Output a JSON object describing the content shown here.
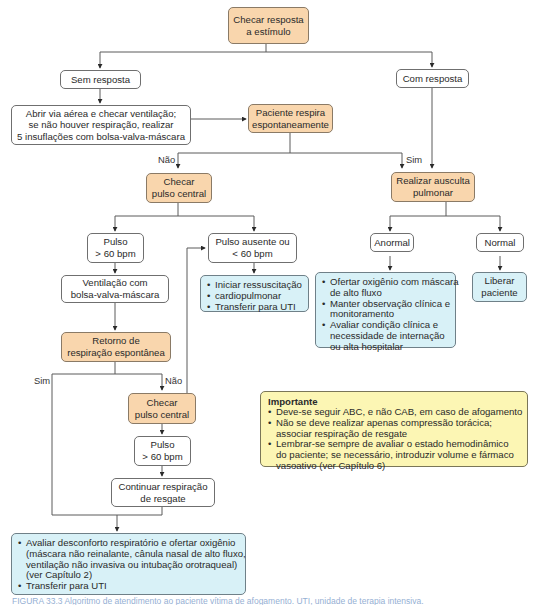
{
  "diagram": {
    "colors": {
      "decision_fill": "#f9d6ad",
      "action_fill": "#d8f1f7",
      "note_fill": "#fcf6b4",
      "plain_fill": "#ffffff",
      "line": "#555555"
    },
    "nodes": {
      "checar_resposta": {
        "lines": [
          "Checar resposta",
          "a estímulo"
        ]
      },
      "sem_resposta": {
        "lines": [
          "Sem resposta"
        ]
      },
      "com_resposta": {
        "lines": [
          "Com resposta"
        ]
      },
      "abrir_via": {
        "lines": [
          "Abrir via aérea e checar ventilação;",
          "se não houver respiração, realizar",
          "5 insuflações com bolsa-valva-máscara"
        ]
      },
      "paciente_respira": {
        "lines": [
          "Paciente respira",
          "espontaneamente"
        ]
      },
      "checar_pulso_1": {
        "lines": [
          "Checar",
          "pulso central"
        ]
      },
      "ausculta": {
        "lines": [
          "Realizar ausculta",
          "pulmonar"
        ]
      },
      "pulso_60_1": {
        "lines": [
          "Pulso",
          "> 60 bpm"
        ]
      },
      "pulso_ausente": {
        "lines": [
          "Pulso ausente ou",
          "< 60 bpm"
        ]
      },
      "anormal": {
        "lines": [
          "Anormal"
        ]
      },
      "normal": {
        "lines": [
          "Normal"
        ]
      },
      "ventilacao": {
        "lines": [
          "Ventilação com",
          "bolsa-valva-máscara"
        ]
      },
      "rcp": {
        "items": [
          "Iniciar ressuscitação",
          "cardiopulmonar",
          "Transferir para UTI"
        ]
      },
      "ofertar": {
        "items": [
          "Ofertar oxigênio com máscara",
          "de alto fluxo",
          "Manter observação clínica e",
          "monitoramento",
          "Avaliar condição clínica e",
          "necessidade de internação",
          "ou alta hospitalar"
        ]
      },
      "liberar": {
        "lines": [
          "Liberar",
          "paciente"
        ]
      },
      "retorno": {
        "lines": [
          "Retorno de",
          "respiração espontânea"
        ]
      },
      "checar_pulso_2": {
        "lines": [
          "Checar",
          "pulso central"
        ]
      },
      "pulso_60_2": {
        "lines": [
          "Pulso",
          "> 60 bpm"
        ]
      },
      "continuar": {
        "lines": [
          "Continuar respiração",
          "de resgate"
        ]
      },
      "avaliar": {
        "items": [
          "Avaliar desconforto respiratório e ofertar oxigênio",
          "(máscara não reinalante, cânula nasal de alto fluxo,",
          "ventilação não invasiva ou intubação orotraqueal)",
          "(ver Capítulo 2)",
          "Transferir para UTI"
        ]
      }
    },
    "edge_labels": {
      "nao_1": "Não",
      "sim_1": "Sim",
      "sim_2": "Sim",
      "nao_2": "Não"
    },
    "note": {
      "title": "Importante",
      "items": [
        "Deve-se seguir ABC, e não CAB, em caso de afogamento",
        "Não se deve realizar apenas compressão torácica;",
        "associar respiração de resgate",
        "Lembrar-se sempre de avaliar o estado hemodinâmico",
        "do paciente; se necessário, introduzir volume e fármaco",
        "vasoativo (ver Capítulo 6)"
      ]
    },
    "caption": "FIGURA 33.3 Algoritmo de atendimento ao paciente vítima de afogamento. UTI, unidade de terapia intensiva."
  }
}
